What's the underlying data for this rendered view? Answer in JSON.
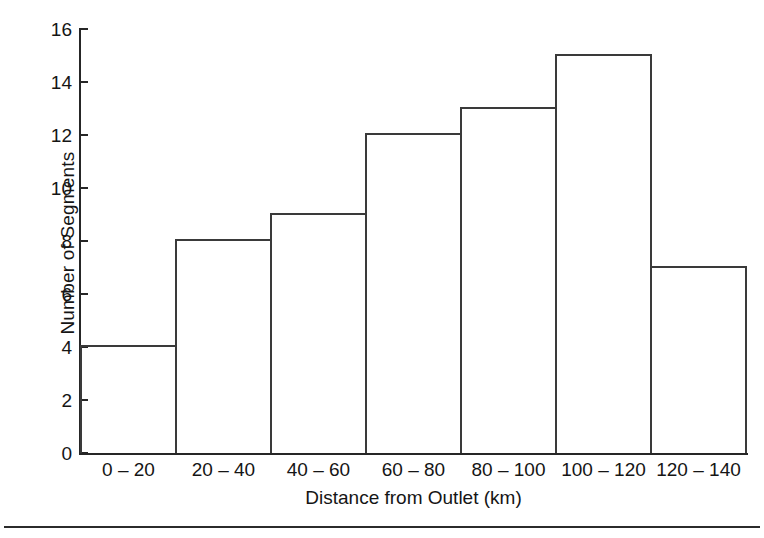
{
  "figure": {
    "background_color": "#ffffff",
    "line_color": "#3a3a3a",
    "text_color": "#151515"
  },
  "chart_data": {
    "type": "bar",
    "title": "",
    "subtitle": "",
    "xlabel": "Distance from Outlet (km)",
    "ylabel": "Number of Segments",
    "categories": [
      "0 – 20",
      "20 – 40",
      "40 – 60",
      "60 – 80",
      "80 – 100",
      "100 – 120",
      "120 – 140"
    ],
    "values": [
      4,
      8,
      9,
      12,
      13,
      15,
      7
    ],
    "ylim": [
      0,
      16
    ],
    "ytick_values": [
      0,
      2,
      4,
      6,
      8,
      10,
      12,
      14,
      16
    ],
    "ytick_labels": [
      "0",
      "2",
      "4",
      "6",
      "8",
      "10",
      "12",
      "14",
      "16"
    ],
    "grid": false,
    "legend": null,
    "bar_style": "outline",
    "bar_gap": 0,
    "annotations": []
  },
  "axes": {
    "y_title": "Number of Segments",
    "x_title": "Distance from Outlet (km)"
  },
  "footer": {
    "rule": true
  }
}
